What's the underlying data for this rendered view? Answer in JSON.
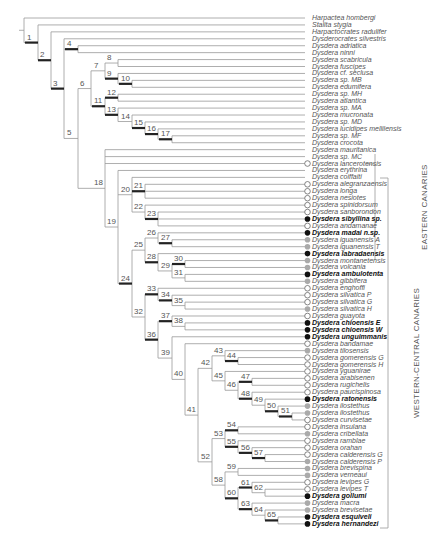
{
  "figure": {
    "type": "phylogenetic-tree",
    "leaf_start_y": 18,
    "leaf_step": 6.93,
    "leaf_end_x": 305,
    "colors": {
      "line": "#999999",
      "support_bar": "#222222",
      "marker_black": "#111111",
      "marker_grey": "#aaaaaa",
      "marker_white_stroke": "#666666"
    }
  },
  "leaves": [
    {
      "name": "Harpactea hombergi",
      "bold": false,
      "marker": "none"
    },
    {
      "name": "Stalita stygia",
      "bold": false,
      "marker": "none"
    },
    {
      "name": "Harpactocrates radulifer",
      "bold": false,
      "marker": "none"
    },
    {
      "name": "Dysderocrates silvestris",
      "bold": false,
      "marker": "none"
    },
    {
      "name": "Dysdera  adriatica",
      "bold": false,
      "marker": "none"
    },
    {
      "name": "Dysdera ninni",
      "bold": false,
      "marker": "none"
    },
    {
      "name": "Dysdera scabricula",
      "bold": false,
      "marker": "none"
    },
    {
      "name": "Dysdera fuscipes",
      "bold": false,
      "marker": "none"
    },
    {
      "name": "Dysdera cf. seclusa",
      "bold": false,
      "marker": "none"
    },
    {
      "name": "Dysdera sp. MB",
      "bold": false,
      "marker": "none"
    },
    {
      "name": "Dysdera edumifera",
      "bold": false,
      "marker": "none"
    },
    {
      "name": "Dysdera sp. MH",
      "bold": false,
      "marker": "none"
    },
    {
      "name": "Dysdera atlantica",
      "bold": false,
      "marker": "none"
    },
    {
      "name": "Dysdera sp. MA",
      "bold": false,
      "marker": "none"
    },
    {
      "name": "Dysdera mucronata",
      "bold": false,
      "marker": "none"
    },
    {
      "name": "Dysdera sp. MD",
      "bold": false,
      "marker": "none"
    },
    {
      "name": "Dysdera lucidipes mellilensis",
      "bold": false,
      "marker": "none"
    },
    {
      "name": "Dysdera sp. MF",
      "bold": false,
      "marker": "none"
    },
    {
      "name": "Dysdera crocota",
      "bold": false,
      "marker": "none"
    },
    {
      "name": "Dysdera mauritanica",
      "bold": false,
      "marker": "none"
    },
    {
      "name": "Dysdera sp. MC",
      "bold": false,
      "marker": "none"
    },
    {
      "name": "Dysdera lancerotensis",
      "bold": false,
      "marker": "white"
    },
    {
      "name": "Dysdera erythrina",
      "bold": false,
      "marker": "none"
    },
    {
      "name": "Dysdera coiffaiti",
      "bold": false,
      "marker": "none"
    },
    {
      "name": "Dysdera alegranzaensis",
      "bold": false,
      "marker": "white"
    },
    {
      "name": "Dysdera longa",
      "bold": false,
      "marker": "white"
    },
    {
      "name": "Dysdera nesiotes",
      "bold": false,
      "marker": "white"
    },
    {
      "name": "Dysdera spinidorsum",
      "bold": false,
      "marker": "white"
    },
    {
      "name": "Dysdera sanborondon",
      "bold": false,
      "marker": "white"
    },
    {
      "name": "Dysdera sibyllina sp.",
      "bold": true,
      "marker": "black"
    },
    {
      "name": "Dysdera andamanae",
      "bold": false,
      "marker": "white"
    },
    {
      "name": "Dysdera madai n.sp.",
      "bold": true,
      "marker": "black"
    },
    {
      "name": "Dysdera iguanensis A",
      "bold": false,
      "marker": "grey"
    },
    {
      "name": "Dysdera iguanensis T",
      "bold": false,
      "marker": "grey"
    },
    {
      "name": "Dysdera labradaensis",
      "bold": true,
      "marker": "black"
    },
    {
      "name": "Dysdera montanetensis",
      "bold": false,
      "marker": "grey"
    },
    {
      "name": "Dysdera volcania",
      "bold": false,
      "marker": "grey"
    },
    {
      "name": "Dysdera ambulotenta",
      "bold": true,
      "marker": "black"
    },
    {
      "name": "Dysdera gibbifera",
      "bold": false,
      "marker": "grey"
    },
    {
      "name": "Dysdera enghoffi",
      "bold": false,
      "marker": "white"
    },
    {
      "name": "Dysdera silvatica P",
      "bold": false,
      "marker": "white"
    },
    {
      "name": "Dysdera silvatica G",
      "bold": false,
      "marker": "white"
    },
    {
      "name": "Dysdera silvatica H",
      "bold": false,
      "marker": "grey"
    },
    {
      "name": "Dysdera guayota",
      "bold": false,
      "marker": "white"
    },
    {
      "name": "Dysdera chioensis E",
      "bold": true,
      "marker": "black"
    },
    {
      "name": "Dysdera chioensis W",
      "bold": true,
      "marker": "black"
    },
    {
      "name": "Dysdera unguimmanis",
      "bold": true,
      "marker": "black"
    },
    {
      "name": "Dysdera bandamae",
      "bold": false,
      "marker": "white"
    },
    {
      "name": "Dysdera tilosensis",
      "bold": false,
      "marker": "grey"
    },
    {
      "name": "Dysdera gomerensis G",
      "bold": false,
      "marker": "white"
    },
    {
      "name": "Dysdera gomerensis H",
      "bold": false,
      "marker": "white"
    },
    {
      "name": "Dysdera yguanirae",
      "bold": false,
      "marker": "white"
    },
    {
      "name": "Dysdera arabisenen",
      "bold": false,
      "marker": "white"
    },
    {
      "name": "Dysdera rugichelis",
      "bold": false,
      "marker": "white"
    },
    {
      "name": "Dysdera paucispinosa",
      "bold": false,
      "marker": "white"
    },
    {
      "name": "Dysdera ratonensis",
      "bold": true,
      "marker": "black"
    },
    {
      "name": "Dysdera ilostethus",
      "bold": false,
      "marker": "grey"
    },
    {
      "name": "Dysdera ilostethus",
      "bold": false,
      "marker": "grey"
    },
    {
      "name": "Dysdera curvisetae",
      "bold": false,
      "marker": "white"
    },
    {
      "name": "Dysdera insulana",
      "bold": false,
      "marker": "white"
    },
    {
      "name": "Dysdera cribellata",
      "bold": false,
      "marker": "grey"
    },
    {
      "name": "Dysdera ramblae",
      "bold": false,
      "marker": "white"
    },
    {
      "name": "Dysdera orahan",
      "bold": false,
      "marker": "white"
    },
    {
      "name": "Dysdera calderensis G",
      "bold": false,
      "marker": "white"
    },
    {
      "name": "Dysdera calderensis P",
      "bold": false,
      "marker": "grey"
    },
    {
      "name": "Dysdera brevispina",
      "bold": false,
      "marker": "grey"
    },
    {
      "name": "Dysdera verneaui",
      "bold": false,
      "marker": "grey"
    },
    {
      "name": "Dysdera levipes G",
      "bold": false,
      "marker": "white"
    },
    {
      "name": "Dysdera levipes T",
      "bold": false,
      "marker": "white"
    },
    {
      "name": "Dysdera gollumi",
      "bold": true,
      "marker": "black"
    },
    {
      "name": "Dysdera macra",
      "bold": false,
      "marker": "grey"
    },
    {
      "name": "Dysdera brevisetae",
      "bold": false,
      "marker": "grey"
    },
    {
      "name": "Dysdera esquiveli",
      "bold": true,
      "marker": "black"
    },
    {
      "name": "Dysdera hernandezi",
      "bold": true,
      "marker": "black"
    }
  ],
  "nodes": [
    {
      "id": "root",
      "x": 24,
      "children": [
        0,
        "n1"
      ],
      "label": "",
      "bar": false
    },
    {
      "id": "n1",
      "x": 38,
      "children": [
        1,
        "n2"
      ],
      "label": "1",
      "bar": true
    },
    {
      "id": "n2",
      "x": 51,
      "children": [
        2,
        "n3"
      ],
      "label": "2",
      "bar": true
    },
    {
      "id": "n3",
      "x": 64,
      "children": [
        3,
        "n4",
        "n5"
      ],
      "label": "3",
      "bar": true
    },
    {
      "id": "n4",
      "x": 78,
      "children": [
        4,
        5
      ],
      "label": "4",
      "bar": true
    },
    {
      "id": "n5",
      "x": 78,
      "children": [
        "n6",
        "n18"
      ],
      "label": "5",
      "bar": false
    },
    {
      "id": "n6",
      "x": 91,
      "children": [
        "n7",
        "n11"
      ],
      "label": "6",
      "bar": false
    },
    {
      "id": "n7",
      "x": 105,
      "children": [
        "n8",
        "n9"
      ],
      "label": "7",
      "bar": false
    },
    {
      "id": "n8",
      "x": 118,
      "children": [
        6,
        7
      ],
      "label": "8",
      "bar": false
    },
    {
      "id": "n9",
      "x": 118,
      "children": [
        8,
        "n10"
      ],
      "label": "9",
      "bar": true
    },
    {
      "id": "n10",
      "x": 132,
      "children": [
        9,
        10
      ],
      "label": "10",
      "bar": true
    },
    {
      "id": "n11",
      "x": 105,
      "children": [
        "n12",
        "n13"
      ],
      "label": "11",
      "bar": true
    },
    {
      "id": "n12",
      "x": 118,
      "children": [
        11,
        12
      ],
      "label": "12",
      "bar": true
    },
    {
      "id": "n13",
      "x": 118,
      "children": [
        13,
        "n14"
      ],
      "label": "13",
      "bar": true
    },
    {
      "id": "n14",
      "x": 132,
      "children": [
        14,
        "n15"
      ],
      "label": "14",
      "bar": false
    },
    {
      "id": "n15",
      "x": 145,
      "children": [
        15,
        "n16"
      ],
      "label": "15",
      "bar": true
    },
    {
      "id": "n16",
      "x": 158,
      "children": [
        16,
        "n17"
      ],
      "label": "16",
      "bar": true
    },
    {
      "id": "n17",
      "x": 172,
      "children": [
        17,
        18
      ],
      "label": "17",
      "bar": true
    },
    {
      "id": "n18",
      "x": 105,
      "children": [
        19,
        20,
        21,
        "n19"
      ],
      "label": "18",
      "bar": false
    },
    {
      "id": "n19",
      "x": 118,
      "children": [
        22,
        "n20",
        "n24"
      ],
      "label": "19",
      "bar": false
    },
    {
      "id": "n20",
      "x": 132,
      "children": [
        23,
        "n21",
        "n22"
      ],
      "label": "20",
      "bar": false
    },
    {
      "id": "n21",
      "x": 145,
      "children": [
        24,
        25,
        26
      ],
      "label": "21",
      "bar": true
    },
    {
      "id": "n22",
      "x": 145,
      "children": [
        27,
        "n23"
      ],
      "label": "22",
      "bar": false
    },
    {
      "id": "n23",
      "x": 158,
      "children": [
        28,
        29,
        30
      ],
      "label": "23",
      "bar": true
    },
    {
      "id": "n24",
      "x": 132,
      "children": [
        "n25",
        "n32"
      ],
      "label": "24",
      "bar": true
    },
    {
      "id": "n25",
      "x": 145,
      "children": [
        "n26",
        "n28"
      ],
      "label": "25",
      "bar": false
    },
    {
      "id": "n26",
      "x": 158,
      "children": [
        31,
        "n27"
      ],
      "label": "26",
      "bar": false
    },
    {
      "id": "n27",
      "x": 172,
      "children": [
        32,
        33
      ],
      "label": "27",
      "bar": true
    },
    {
      "id": "n28",
      "x": 158,
      "children": [
        34,
        "n29"
      ],
      "label": "28",
      "bar": true
    },
    {
      "id": "n29",
      "x": 172,
      "children": [
        "n30",
        "n31"
      ],
      "label": "29",
      "bar": false
    },
    {
      "id": "n30",
      "x": 185,
      "children": [
        35,
        36
      ],
      "label": "30",
      "bar": true
    },
    {
      "id": "n31",
      "x": 185,
      "children": [
        37,
        38
      ],
      "label": "31",
      "bar": false
    },
    {
      "id": "n32",
      "x": 145,
      "children": [
        "n33",
        "n36"
      ],
      "label": "32",
      "bar": false
    },
    {
      "id": "n33",
      "x": 158,
      "children": [
        39,
        "n34"
      ],
      "label": "33",
      "bar": true
    },
    {
      "id": "n34",
      "x": 172,
      "children": [
        40,
        "n35"
      ],
      "label": "34",
      "bar": true
    },
    {
      "id": "n35",
      "x": 185,
      "children": [
        41,
        42
      ],
      "label": "35",
      "bar": false
    },
    {
      "id": "n36",
      "x": 158,
      "children": [
        "n37",
        "n39"
      ],
      "label": "36",
      "bar": true
    },
    {
      "id": "n37",
      "x": 172,
      "children": [
        43,
        "n38"
      ],
      "label": "37",
      "bar": true
    },
    {
      "id": "n38",
      "x": 185,
      "children": [
        44,
        45
      ],
      "label": "38",
      "bar": false
    },
    {
      "id": "n39",
      "x": 172,
      "children": [
        46,
        "n40"
      ],
      "label": "39",
      "bar": false
    },
    {
      "id": "n40",
      "x": 185,
      "children": [
        47,
        "n41"
      ],
      "label": "40",
      "bar": false
    },
    {
      "id": "n41",
      "x": 198,
      "children": [
        "n42",
        "n52"
      ],
      "label": "41",
      "bar": false
    },
    {
      "id": "n42",
      "x": 212,
      "children": [
        "n43",
        "n45"
      ],
      "label": "42",
      "bar": false
    },
    {
      "id": "n43",
      "x": 225,
      "children": [
        48,
        "n44"
      ],
      "label": "43",
      "bar": false
    },
    {
      "id": "n44",
      "x": 238,
      "children": [
        49,
        50
      ],
      "label": "44",
      "bar": true
    },
    {
      "id": "n45",
      "x": 225,
      "children": [
        51,
        "n46"
      ],
      "label": "45",
      "bar": false
    },
    {
      "id": "n46",
      "x": 238,
      "children": [
        "n47",
        "n48"
      ],
      "label": "46",
      "bar": false
    },
    {
      "id": "n47",
      "x": 252,
      "children": [
        52,
        53
      ],
      "label": "47",
      "bar": true
    },
    {
      "id": "n48",
      "x": 252,
      "children": [
        54,
        "n49"
      ],
      "label": "48",
      "bar": true
    },
    {
      "id": "n49",
      "x": 265,
      "children": [
        55,
        "n50"
      ],
      "label": "49",
      "bar": false
    },
    {
      "id": "n50",
      "x": 278,
      "children": [
        56,
        "n51"
      ],
      "label": "50",
      "bar": true
    },
    {
      "id": "n51",
      "x": 292,
      "children": [
        57,
        58
      ],
      "label": "51",
      "bar": true
    },
    {
      "id": "n52",
      "x": 212,
      "children": [
        "n53",
        "n58"
      ],
      "label": "52",
      "bar": false
    },
    {
      "id": "n53",
      "x": 225,
      "children": [
        "n54",
        "n55"
      ],
      "label": "53",
      "bar": false
    },
    {
      "id": "n54",
      "x": 238,
      "children": [
        59,
        60
      ],
      "label": "54",
      "bar": true
    },
    {
      "id": "n55",
      "x": 238,
      "children": [
        61,
        "n56"
      ],
      "label": "55",
      "bar": true
    },
    {
      "id": "n56",
      "x": 252,
      "children": [
        62,
        "n57"
      ],
      "label": "56",
      "bar": true
    },
    {
      "id": "n57",
      "x": 265,
      "children": [
        63,
        64
      ],
      "label": "57",
      "bar": true
    },
    {
      "id": "n58",
      "x": 225,
      "children": [
        "n59",
        "n60"
      ],
      "label": "58",
      "bar": false
    },
    {
      "id": "n59",
      "x": 238,
      "children": [
        65,
        66
      ],
      "label": "59",
      "bar": false
    },
    {
      "id": "n60",
      "x": 238,
      "children": [
        "n61",
        "n63"
      ],
      "label": "60",
      "bar": true
    },
    {
      "id": "n61",
      "x": 252,
      "children": [
        67,
        "n62"
      ],
      "label": "61",
      "bar": true
    },
    {
      "id": "n62",
      "x": 265,
      "children": [
        68,
        69
      ],
      "label": "62",
      "bar": false
    },
    {
      "id": "n63",
      "x": 252,
      "children": [
        70,
        "n64"
      ],
      "label": "63",
      "bar": true
    },
    {
      "id": "n64",
      "x": 265,
      "children": [
        71,
        "n65"
      ],
      "label": "64",
      "bar": false
    },
    {
      "id": "n65",
      "x": 278,
      "children": [
        72,
        73
      ],
      "label": "65",
      "bar": true
    }
  ],
  "regions": [
    {
      "label": "EASTERN CANARIES",
      "top_y": 154,
      "bottom_y": 260,
      "x": 376,
      "marker_y": 164,
      "bracket": "tick"
    },
    {
      "label": "WESTERN-CENTRAL CANARIES",
      "top_y": 178,
      "bottom_y": 528,
      "x": 392,
      "marker_y": 215,
      "bracket": "bracket"
    }
  ]
}
